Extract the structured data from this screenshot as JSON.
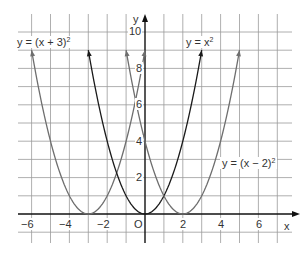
{
  "chart_data": {
    "type": "line",
    "title": "",
    "xlabel": "x",
    "ylabel": "y",
    "xlim": [
      -7,
      7.5
    ],
    "ylim": [
      -1,
      11
    ],
    "grid": true,
    "x_tick_labels": [
      "−6",
      "−4",
      "−2",
      "O",
      "2",
      "4",
      "6"
    ],
    "x_tick_values": [
      -6,
      -4,
      -2,
      0,
      2,
      4,
      6
    ],
    "y_tick_labels": [
      "2",
      "4",
      "6",
      "8",
      "10"
    ],
    "y_tick_values": [
      2,
      4,
      6,
      8,
      10
    ],
    "series": [
      {
        "name": "y = (x + 3)²",
        "label_main": "y = (x + 3)",
        "label_exp": "2",
        "shift": -3,
        "color": "#6e6e6e",
        "x_range": [
          -6,
          0
        ]
      },
      {
        "name": "y = x²",
        "label_main": "y = x",
        "label_exp": "2",
        "shift": 0,
        "color": "#1a1a1a",
        "x_range": [
          -3,
          3
        ]
      },
      {
        "name": "y = (x − 2)²",
        "label_main": "y = (x − 2)",
        "label_exp": "2",
        "shift": 2,
        "color": "#6e6e6e",
        "x_range": [
          -1,
          5
        ]
      }
    ],
    "annotations": [
      "y = (x + 3)²",
      "y = x²",
      "y = (x − 2)²"
    ]
  },
  "labels": {
    "axis_x": "x",
    "axis_y": "y"
  }
}
